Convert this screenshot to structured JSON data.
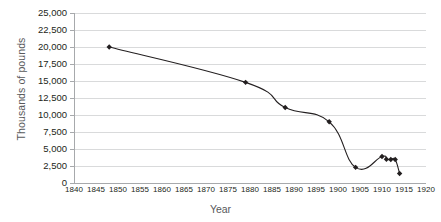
{
  "chart_data": {
    "type": "line",
    "title": "",
    "xlabel": "Year",
    "ylabel": "Thousands of pounds",
    "xlim": [
      1840,
      1920
    ],
    "ylim": [
      0,
      25000
    ],
    "grid": true,
    "legend": "none",
    "marker": "diamond",
    "line_color": "#231f20",
    "marker_color": "#231f20",
    "gridline_color": "#d9dadb",
    "axis_color": "#a7a9ac",
    "xticks": [
      1840,
      1845,
      1850,
      1855,
      1860,
      1865,
      1870,
      1875,
      1880,
      1885,
      1890,
      1895,
      1900,
      1905,
      1910,
      1915,
      1920
    ],
    "xtick_labels": [
      "1840",
      "1845",
      "1850",
      "1855",
      "1860",
      "1865",
      "1870",
      "1875",
      "1880",
      "1885",
      "1890",
      "1895",
      "1900",
      "1905",
      "1910",
      "1915",
      "1920"
    ],
    "yticks": [
      0,
      2500,
      5000,
      7500,
      10000,
      12500,
      15000,
      17500,
      20000,
      22500,
      25000
    ],
    "ytick_labels": [
      "0",
      "2,500",
      "5,000",
      "7,500",
      "10,000",
      "12,500",
      "15,000",
      "17,500",
      "20,000",
      "22,500",
      "25,000"
    ],
    "x": [
      1848,
      1879,
      1888,
      1898,
      1904,
      1910,
      1911,
      1912,
      1913,
      1914
    ],
    "values": [
      20000,
      14800,
      11100,
      9000,
      2300,
      3900,
      3500,
      3450,
      3450,
      1400
    ],
    "series": [
      {
        "name": "Thousands of pounds",
        "points": [
          {
            "x": 1848,
            "y": 20000
          },
          {
            "x": 1879,
            "y": 14800
          },
          {
            "x": 1888,
            "y": 11100
          },
          {
            "x": 1898,
            "y": 9000
          },
          {
            "x": 1904,
            "y": 2300
          },
          {
            "x": 1910,
            "y": 3900
          },
          {
            "x": 1911,
            "y": 3500
          },
          {
            "x": 1912,
            "y": 3450
          },
          {
            "x": 1913,
            "y": 3450
          },
          {
            "x": 1914,
            "y": 1400
          }
        ]
      }
    ]
  }
}
